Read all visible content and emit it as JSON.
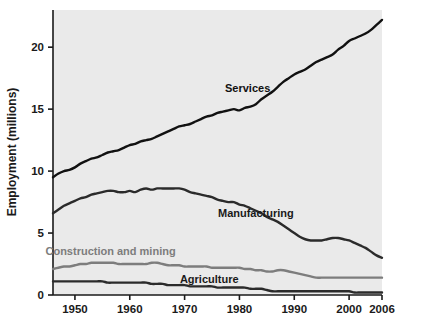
{
  "chart_data": {
    "type": "line",
    "title": "",
    "xlabel": "",
    "ylabel": "Employment (millions)",
    "xlim": [
      1946,
      2006
    ],
    "ylim": [
      0,
      23
    ],
    "grid": false,
    "legend_position": "inline-labels",
    "background_color": "#eaeaea",
    "xticks": [
      1950,
      1960,
      1970,
      1980,
      1990,
      2000,
      2006
    ],
    "xtick_labels": [
      "1950",
      "1960",
      "1970",
      "1980",
      "1990",
      "2000",
      "2006"
    ],
    "yticks": [
      0,
      5,
      10,
      15,
      20
    ],
    "ytick_labels": [
      "0",
      "5",
      "10",
      "15",
      "20"
    ],
    "x": [
      1946,
      1947,
      1948,
      1949,
      1950,
      1951,
      1952,
      1953,
      1954,
      1955,
      1956,
      1957,
      1958,
      1959,
      1960,
      1961,
      1962,
      1963,
      1964,
      1965,
      1966,
      1967,
      1968,
      1969,
      1970,
      1971,
      1972,
      1973,
      1974,
      1975,
      1976,
      1977,
      1978,
      1979,
      1980,
      1981,
      1982,
      1983,
      1984,
      1985,
      1986,
      1987,
      1988,
      1989,
      1990,
      1991,
      1992,
      1993,
      1994,
      1995,
      1996,
      1997,
      1998,
      1999,
      2000,
      2001,
      2002,
      2003,
      2004,
      2005,
      2006
    ],
    "series": [
      {
        "name": "Services",
        "color": "#111111",
        "label_color": "#111111",
        "label_x": 1981.5,
        "label_y": 16.4,
        "values": [
          9.5,
          9.8,
          10.0,
          10.1,
          10.3,
          10.6,
          10.8,
          11.0,
          11.1,
          11.3,
          11.5,
          11.6,
          11.7,
          11.9,
          12.1,
          12.2,
          12.4,
          12.5,
          12.6,
          12.8,
          13.0,
          13.2,
          13.4,
          13.6,
          13.7,
          13.8,
          14.0,
          14.2,
          14.4,
          14.5,
          14.7,
          14.8,
          14.9,
          15.0,
          14.9,
          15.1,
          15.2,
          15.4,
          15.8,
          16.1,
          16.4,
          16.8,
          17.2,
          17.5,
          17.8,
          18.0,
          18.2,
          18.5,
          18.8,
          19.0,
          19.2,
          19.4,
          19.8,
          20.1,
          20.5,
          20.7,
          20.9,
          21.1,
          21.4,
          21.8,
          22.2
        ]
      },
      {
        "name": "Manufacturing",
        "color": "#2b2b2b",
        "label_color": "#1a1a1a",
        "label_x": 1983.0,
        "label_y": 6.3,
        "values": [
          6.6,
          6.9,
          7.2,
          7.4,
          7.6,
          7.8,
          7.9,
          8.1,
          8.2,
          8.3,
          8.4,
          8.4,
          8.3,
          8.3,
          8.4,
          8.3,
          8.5,
          8.6,
          8.5,
          8.6,
          8.6,
          8.6,
          8.6,
          8.6,
          8.5,
          8.3,
          8.2,
          8.1,
          8.0,
          7.9,
          7.7,
          7.6,
          7.5,
          7.5,
          7.3,
          7.2,
          7.0,
          6.8,
          6.6,
          6.3,
          6.1,
          5.9,
          5.6,
          5.3,
          5.0,
          4.7,
          4.5,
          4.4,
          4.4,
          4.4,
          4.5,
          4.6,
          4.6,
          4.5,
          4.4,
          4.2,
          4.0,
          3.8,
          3.5,
          3.2,
          3.0
        ]
      },
      {
        "name": "Construction and mining",
        "color": "#7d7d7d",
        "label_color": "#7d7d7d",
        "label_x": 1956.5,
        "label_y": 3.25,
        "values": [
          2.1,
          2.2,
          2.3,
          2.3,
          2.4,
          2.5,
          2.5,
          2.6,
          2.6,
          2.6,
          2.6,
          2.6,
          2.5,
          2.5,
          2.5,
          2.5,
          2.5,
          2.5,
          2.6,
          2.6,
          2.5,
          2.4,
          2.4,
          2.4,
          2.3,
          2.3,
          2.3,
          2.3,
          2.3,
          2.2,
          2.2,
          2.2,
          2.2,
          2.2,
          2.2,
          2.1,
          2.1,
          2.0,
          2.0,
          1.9,
          1.9,
          2.0,
          2.0,
          1.9,
          1.8,
          1.7,
          1.6,
          1.5,
          1.4,
          1.4,
          1.4,
          1.4,
          1.4,
          1.4,
          1.4,
          1.4,
          1.4,
          1.4,
          1.4,
          1.4,
          1.4
        ]
      },
      {
        "name": "Agriculture",
        "color": "#2b2b2b",
        "label_color": "#1a1a1a",
        "label_x": 1974.5,
        "label_y": 1.0,
        "values": [
          1.1,
          1.1,
          1.1,
          1.1,
          1.1,
          1.1,
          1.1,
          1.1,
          1.1,
          1.1,
          1.0,
          1.0,
          1.0,
          1.0,
          1.0,
          1.0,
          1.0,
          1.0,
          0.9,
          0.9,
          0.9,
          0.8,
          0.8,
          0.8,
          0.8,
          0.7,
          0.7,
          0.7,
          0.7,
          0.7,
          0.6,
          0.6,
          0.6,
          0.6,
          0.6,
          0.6,
          0.5,
          0.5,
          0.5,
          0.4,
          0.3,
          0.3,
          0.3,
          0.3,
          0.3,
          0.3,
          0.3,
          0.3,
          0.3,
          0.3,
          0.3,
          0.3,
          0.3,
          0.3,
          0.3,
          0.2,
          0.2,
          0.2,
          0.2,
          0.2,
          0.2
        ]
      }
    ]
  }
}
